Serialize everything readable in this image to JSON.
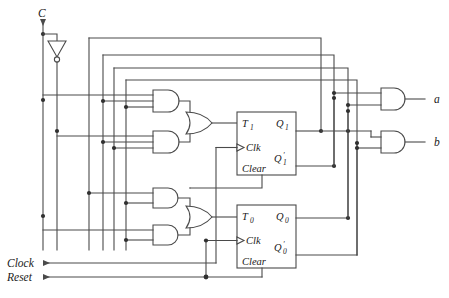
{
  "diagram": {
    "type": "logic-circuit-schematic",
    "background": "#ffffff",
    "wire_color": "#4a4a4a",
    "label_color": "#1a1a1a"
  },
  "inputs": [
    {
      "id": "c",
      "label": "C"
    },
    {
      "id": "clock",
      "label": "Clock"
    },
    {
      "id": "reset",
      "label": "Reset"
    }
  ],
  "outputs": [
    {
      "id": "a",
      "label": "a"
    },
    {
      "id": "b",
      "label": "b"
    }
  ],
  "flipflops": [
    {
      "id": "ff1",
      "t_label": "T",
      "t_sub": "1",
      "clk_label": "Clk",
      "clear_label": "Clear",
      "q_label": "Q",
      "q_sub": "1",
      "qbar_label": "Q",
      "qbar_prime": "′",
      "qbar_sub": "1"
    },
    {
      "id": "ff0",
      "t_label": "T",
      "t_sub": "0",
      "clk_label": "Clk",
      "clear_label": "Clear",
      "q_label": "Q",
      "q_sub": "0",
      "qbar_label": "Q",
      "qbar_prime": "′",
      "qbar_sub": "0"
    }
  ],
  "gates": [
    {
      "id": "not-c",
      "type": "NOT",
      "inputs": 1
    },
    {
      "id": "and-1",
      "type": "AND",
      "inputs": 3
    },
    {
      "id": "and-2",
      "type": "AND",
      "inputs": 3
    },
    {
      "id": "and-3",
      "type": "AND",
      "inputs": 2
    },
    {
      "id": "and-4",
      "type": "AND",
      "inputs": 2
    },
    {
      "id": "or-1",
      "type": "OR",
      "inputs": 2
    },
    {
      "id": "or-0",
      "type": "OR",
      "inputs": 2
    },
    {
      "id": "and-out-a",
      "type": "AND",
      "inputs": 2
    },
    {
      "id": "and-out-b",
      "type": "AND",
      "inputs": 2
    }
  ]
}
